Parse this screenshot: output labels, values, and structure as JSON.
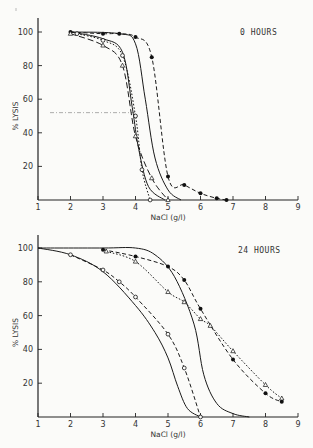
{
  "chart_data": [
    {
      "type": "line",
      "title": "0 HOURS",
      "xlabel": "NaCl (g/l)",
      "ylabel": "% LYSIS",
      "xlim": [
        1,
        9
      ],
      "ylim": [
        0,
        100
      ],
      "x_ticks": [
        "1",
        "2",
        "3",
        "4",
        "5",
        "6",
        "7",
        "8",
        "9"
      ],
      "y_ticks": [
        "20",
        "40",
        "60",
        "80",
        "100"
      ],
      "grid": false,
      "reference_line": {
        "y": 52,
        "x_end": 4.0,
        "style": "dash-dot"
      },
      "series": [
        {
          "name": "filled circles, dashed",
          "marker": "filled-circle",
          "style": "dashed",
          "x": [
            2.0,
            3.0,
            3.5,
            4.0,
            4.5,
            5.0,
            5.5,
            6.0,
            6.5,
            6.8
          ],
          "y": [
            100,
            99,
            99,
            97,
            85,
            14,
            9,
            4,
            1,
            0
          ]
        },
        {
          "name": "solid right",
          "marker": "none",
          "style": "solid",
          "x": [
            2.0,
            3.5,
            4.0,
            4.3,
            4.6,
            5.0,
            5.4
          ],
          "y": [
            100,
            99,
            93,
            60,
            25,
            6,
            0
          ]
        },
        {
          "name": "solid left",
          "marker": "none",
          "style": "solid",
          "x": [
            2.0,
            3.0,
            3.6,
            3.9,
            4.1,
            4.4,
            4.9
          ],
          "y": [
            100,
            96,
            88,
            55,
            30,
            8,
            0
          ]
        },
        {
          "name": "open triangles, long-dash",
          "marker": "open-triangle",
          "style": "long-dash",
          "x": [
            2.0,
            3.0,
            3.6,
            4.0,
            4.5,
            5.0
          ],
          "y": [
            99,
            92,
            80,
            38,
            13,
            0
          ]
        },
        {
          "name": "open circles, dotted",
          "marker": "open-circle",
          "style": "dotted",
          "x": [
            2.2,
            3.0,
            3.6,
            4.0,
            4.2,
            4.45
          ],
          "y": [
            99,
            95,
            86,
            50,
            18,
            0
          ]
        }
      ]
    },
    {
      "type": "line",
      "title": "24 HOURS",
      "xlabel": "NaCl (g/l)",
      "ylabel": "% LYSIS",
      "xlim": [
        1,
        9
      ],
      "ylim": [
        0,
        100
      ],
      "x_ticks": [
        "1",
        "2",
        "3",
        "4",
        "5",
        "6",
        "7",
        "8",
        "9"
      ],
      "y_ticks": [
        "20",
        "40",
        "60",
        "80",
        "100"
      ],
      "grid": false,
      "series": [
        {
          "name": "solid step",
          "marker": "none",
          "style": "solid",
          "x": [
            1,
            3.0,
            4.0,
            4.6,
            5.2,
            5.8,
            6.1,
            6.5,
            7.0,
            7.5
          ],
          "y": [
            100,
            100,
            100,
            96,
            83,
            55,
            25,
            8,
            2,
            0
          ]
        },
        {
          "name": "solid gradual",
          "marker": "none",
          "style": "solid",
          "x": [
            1,
            2,
            3,
            4,
            4.6,
            5.0,
            5.3,
            5.6,
            6.0
          ],
          "y": [
            100,
            96,
            86,
            66,
            50,
            35,
            18,
            5,
            0
          ]
        },
        {
          "name": "open circles, dashed",
          "marker": "open-circle",
          "style": "dashed",
          "x": [
            2,
            3,
            3.5,
            4,
            5,
            5.5,
            6
          ],
          "y": [
            96,
            87,
            80,
            71,
            49,
            29,
            0
          ]
        },
        {
          "name": "filled circles, dashed",
          "marker": "filled-circle",
          "style": "dashed",
          "x": [
            3.0,
            4.0,
            5.0,
            5.5,
            6.0,
            7.0,
            8.0,
            8.5
          ],
          "y": [
            99,
            95,
            89,
            81,
            64,
            34,
            14,
            9
          ]
        },
        {
          "name": "open triangles, dotted",
          "marker": "open-triangle",
          "style": "dotted",
          "x": [
            3.1,
            4.0,
            5.0,
            5.5,
            6.0,
            6.3,
            7.0,
            8.0,
            8.5
          ],
          "y": [
            98,
            92,
            74,
            68,
            58,
            54,
            39,
            19,
            11
          ]
        }
      ]
    }
  ]
}
